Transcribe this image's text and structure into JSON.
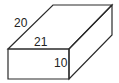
{
  "diagram": {
    "type": "rectangular-prism",
    "labels": {
      "depth": "20",
      "length": "21",
      "height": "10"
    },
    "stroke_color": "#2a2a2a",
    "background": "#ffffff"
  }
}
